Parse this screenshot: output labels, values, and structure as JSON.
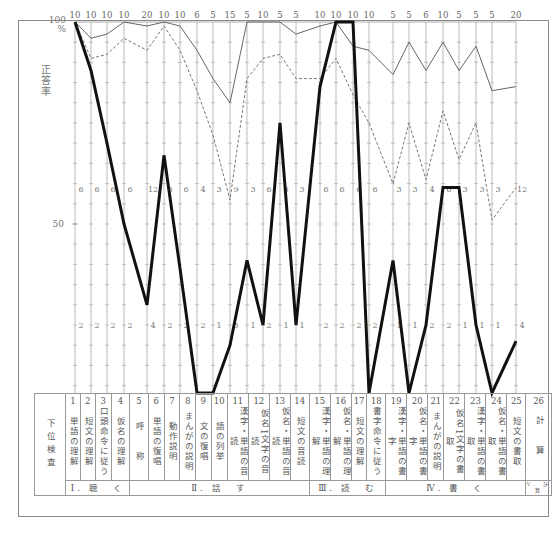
{
  "chart_data": {
    "type": "line",
    "title": "",
    "ylabel": "正答率",
    "ylim": [
      0,
      100
    ],
    "y_ticks": [
      "100 %",
      "50"
    ],
    "x_label": "下位検査",
    "categories": [
      "1",
      "2",
      "3",
      "4",
      "5",
      "6",
      "7",
      "8",
      "9",
      "10",
      "11",
      "12",
      "13",
      "14",
      "15",
      "16",
      "17",
      "18",
      "19",
      "20",
      "21",
      "22",
      "23",
      "24",
      "25",
      "26"
    ],
    "max_scores": [
      10,
      10,
      10,
      10,
      20,
      10,
      10,
      6,
      5,
      15,
      5,
      10,
      5,
      5,
      10,
      10,
      10,
      10,
      5,
      5,
      6,
      10,
      5,
      5,
      5,
      20
    ],
    "threshold_60": [
      6,
      6,
      6,
      6,
      12,
      6,
      6,
      4,
      3,
      9,
      3,
      6,
      3,
      3,
      6,
      6,
      6,
      6,
      3,
      3,
      4,
      6,
      3,
      3,
      3,
      12
    ],
    "threshold_20": [
      2,
      2,
      2,
      2,
      4,
      2,
      2,
      2,
      1,
      3,
      1,
      2,
      1,
      1,
      2,
      2,
      2,
      2,
      1,
      1,
      2,
      2,
      1,
      1,
      1,
      4
    ],
    "series": [
      {
        "name": "thin-solid",
        "style": "solid-thin",
        "values": [
          100,
          96,
          97,
          100,
          99,
          100,
          99,
          93,
          86,
          80,
          100,
          100,
          100,
          97,
          99,
          100,
          94,
          93,
          87,
          95,
          88,
          95,
          88,
          94,
          83,
          84
        ]
      },
      {
        "name": "dashed",
        "style": "dashed",
        "values": [
          100,
          91,
          92,
          96,
          93,
          99,
          93,
          83,
          72,
          56,
          86,
          91,
          92,
          86,
          86,
          91,
          82,
          75,
          60,
          75,
          61,
          78,
          66,
          75,
          51,
          59
        ]
      },
      {
        "name": "bold",
        "style": "solid-bold",
        "values": [
          100,
          88,
          70,
          50,
          30,
          67,
          39,
          8,
          8,
          20,
          41,
          25,
          75,
          25,
          84,
          100,
          100,
          8,
          41,
          8,
          25,
          59,
          59,
          25,
          8,
          21
        ]
      }
    ],
    "grid": true,
    "legend": null
  },
  "table": {
    "header_label": "下位検査",
    "items": [
      {
        "num": "1",
        "text": "単語の理解"
      },
      {
        "num": "2",
        "text": "短文の理解"
      },
      {
        "num": "3",
        "text": "口頭命令に従う"
      },
      {
        "num": "4",
        "text": "仮名の理解"
      },
      {
        "num": "5",
        "text": "呼　　称"
      },
      {
        "num": "6",
        "text": "単語の復唱"
      },
      {
        "num": "7",
        "text": "動作説明"
      },
      {
        "num": "8",
        "text": "まんがの説明"
      },
      {
        "num": "9",
        "text": "文の復唱"
      },
      {
        "num": "10",
        "text": "語の列挙"
      },
      {
        "num": "11",
        "text": "漢字・単語の音読"
      },
      {
        "num": "12",
        "text": "仮名1文字の音読"
      },
      {
        "num": "13",
        "text": "仮名・単語の音読"
      },
      {
        "num": "14",
        "text": "短文の音読"
      },
      {
        "num": "15",
        "text": "漢字・単語の理解"
      },
      {
        "num": "16",
        "text": "仮名・単語の理解"
      },
      {
        "num": "17",
        "text": "短文の理解"
      },
      {
        "num": "18",
        "text": "書字命令に従う"
      },
      {
        "num": "19",
        "text": "漢字・単語の書字"
      },
      {
        "num": "20",
        "text": "仮名・単語の書字"
      },
      {
        "num": "21",
        "text": "まんがの説明"
      },
      {
        "num": "22",
        "text": "仮名1文字の書取"
      },
      {
        "num": "23",
        "text": "漢字・単語の書取"
      },
      {
        "num": "24",
        "text": "仮名・単語の書取"
      },
      {
        "num": "25",
        "text": "短文の書取"
      },
      {
        "num": "26",
        "text": "計　　算"
      }
    ],
    "groups": [
      {
        "label": "Ⅰ. 聴　く",
        "span": 4
      },
      {
        "label": "Ⅱ. 話　す",
        "span": 10
      },
      {
        "label": "Ⅲ. 読　む",
        "span": 4
      },
      {
        "label": "Ⅳ. 書　く",
        "span": 7
      },
      {
        "label": "Ⅴ. 計 算",
        "span": 1
      }
    ]
  }
}
